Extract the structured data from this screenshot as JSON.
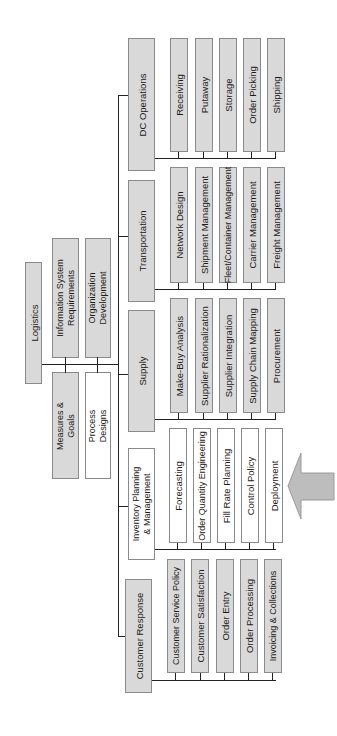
{
  "root": {
    "label": "Logistics"
  },
  "support": [
    {
      "label": "Information System\nRequirements",
      "fill": "gray"
    },
    {
      "label": "Organization\nDevelopment",
      "fill": "gray"
    },
    {
      "label": "Measures &\nGoals",
      "fill": "gray"
    },
    {
      "label": "Process\nDesigns",
      "fill": "white"
    }
  ],
  "categories": [
    {
      "label": "DC Operations",
      "fill": "gray",
      "items": [
        "Receiving",
        "Putaway",
        "Storage",
        "Order Picking",
        "Shipping"
      ]
    },
    {
      "label": "Transportation",
      "fill": "gray",
      "items": [
        "Network Design",
        "Shipment Management",
        "Fleet/Container Management",
        "Carrier Management",
        "Freight Management"
      ]
    },
    {
      "label": "Supply",
      "fill": "gray",
      "items": [
        "Make-Buy Analysis",
        "Supplier Rationalization",
        "Supplier Integration",
        "Supply Chain Mapping",
        "Procurement"
      ]
    },
    {
      "label": "Inventory Planning\n& Management",
      "fill": "white",
      "items": [
        "Forecasting",
        "Order Quantity Engineering",
        "Fill Rate Planning",
        "Control Policy",
        "Deployment"
      ]
    },
    {
      "label": "Customer Response",
      "fill": "gray",
      "items": [
        "Customer Service Policy",
        "Customer Satisfaction",
        "Order Entry",
        "Order Processing",
        "Invoicing & Collections"
      ]
    }
  ],
  "highlight_arrow": {
    "points_to": "Inventory Planning & Management",
    "color": "#bdbdbd"
  },
  "colors": {
    "gray_fill": "#d9d9d9",
    "white_fill": "#ffffff",
    "border": "#8a8a8a",
    "line": "#222222"
  }
}
